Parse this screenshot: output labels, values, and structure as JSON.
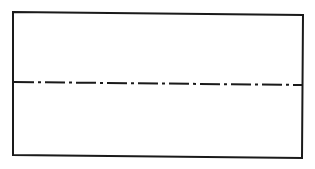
{
  "diagram": {
    "type": "technical-drawing",
    "colors": {
      "background": "#ffffff",
      "stroke": "#1a1a1a"
    },
    "rectangle": {
      "points": [
        [
          13,
          12
        ],
        [
          303,
          15
        ],
        [
          302,
          158
        ],
        [
          13,
          155
        ]
      ],
      "stroke_width": 2
    },
    "center_line": {
      "style": "dash-dot",
      "x1": 14,
      "y1": 82,
      "x2": 302,
      "y2": 85,
      "stroke_width": 2,
      "dasharray": "20 4 3 4"
    }
  }
}
